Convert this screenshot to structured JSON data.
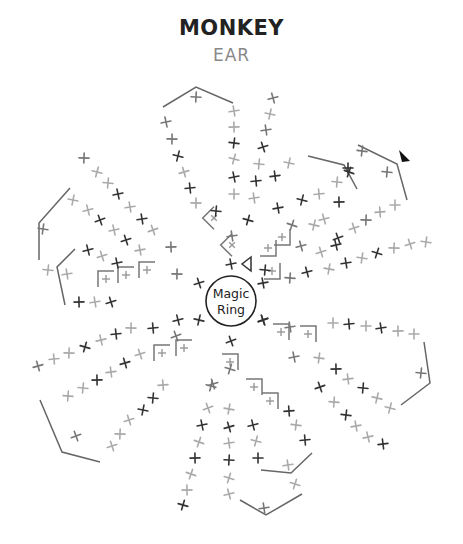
{
  "title": "MONKEY",
  "subtitle": "EAR",
  "center": {
    "label_line1": "Magic",
    "label_line2": "Ring",
    "x": 231,
    "y": 301,
    "r": 25
  },
  "colors": {
    "dark": "#333333",
    "mid": "#777777",
    "light": "#aaaaaa",
    "line": "#666666"
  },
  "symbols": [
    {
      "t": "x",
      "x": 231,
      "y": 264,
      "c": "dark"
    },
    {
      "t": "x",
      "x": 231,
      "y": 341,
      "c": "dark"
    },
    {
      "t": "x",
      "x": 199,
      "y": 283,
      "c": "dark"
    },
    {
      "t": "x",
      "x": 263,
      "y": 283,
      "c": "dark"
    },
    {
      "t": "x",
      "x": 199,
      "y": 320,
      "c": "dark"
    },
    {
      "t": "x",
      "x": 263,
      "y": 320,
      "c": "dark"
    },
    {
      "t": "x",
      "x": 196,
      "y": 97,
      "c": "mid"
    },
    {
      "t": "x",
      "x": 166,
      "y": 122,
      "c": "mid"
    },
    {
      "t": "x",
      "x": 172,
      "y": 139,
      "c": "mid"
    },
    {
      "t": "x",
      "x": 178,
      "y": 156,
      "c": "dark"
    },
    {
      "t": "x",
      "x": 184,
      "y": 172,
      "c": "light"
    },
    {
      "t": "x",
      "x": 190,
      "y": 188,
      "c": "dark"
    },
    {
      "t": "x",
      "x": 196,
      "y": 203,
      "c": "light"
    },
    {
      "t": "x",
      "x": 216,
      "y": 211,
      "c": "dark"
    },
    {
      "t": "x",
      "x": 234,
      "y": 111,
      "c": "light"
    },
    {
      "t": "x",
      "x": 234,
      "y": 127,
      "c": "light"
    },
    {
      "t": "x",
      "x": 234,
      "y": 143,
      "c": "dark"
    },
    {
      "t": "x",
      "x": 234,
      "y": 159,
      "c": "light"
    },
    {
      "t": "x",
      "x": 234,
      "y": 177,
      "c": "dark"
    },
    {
      "t": "x",
      "x": 234,
      "y": 194,
      "c": "light"
    },
    {
      "t": "x",
      "x": 273,
      "y": 98,
      "c": "mid"
    },
    {
      "t": "x",
      "x": 270,
      "y": 114,
      "c": "light"
    },
    {
      "t": "x",
      "x": 266,
      "y": 130,
      "c": "mid"
    },
    {
      "t": "x",
      "x": 263,
      "y": 147,
      "c": "dark"
    },
    {
      "t": "x",
      "x": 259,
      "y": 164,
      "c": "light"
    },
    {
      "t": "x",
      "x": 256,
      "y": 181,
      "c": "dark"
    },
    {
      "t": "x",
      "x": 254,
      "y": 198,
      "c": "light"
    },
    {
      "t": "x",
      "x": 248,
      "y": 220,
      "c": "dark"
    },
    {
      "t": "x",
      "x": 232,
      "y": 236,
      "c": "mid"
    },
    {
      "t": "x",
      "x": 348,
      "y": 168,
      "c": "dark"
    },
    {
      "t": "x",
      "x": 337,
      "y": 182,
      "c": "light"
    },
    {
      "t": "x",
      "x": 319,
      "y": 194,
      "c": "light"
    },
    {
      "t": "x",
      "x": 302,
      "y": 200,
      "c": "dark"
    },
    {
      "t": "x",
      "x": 292,
      "y": 225,
      "c": "mid"
    },
    {
      "t": "x",
      "x": 301,
      "y": 246,
      "c": "mid"
    },
    {
      "t": "x",
      "x": 289,
      "y": 163,
      "c": "light"
    },
    {
      "t": "x",
      "x": 275,
      "y": 176,
      "c": "dark"
    },
    {
      "t": "x",
      "x": 278,
      "y": 208,
      "c": "dark"
    },
    {
      "t": "x",
      "x": 314,
      "y": 225,
      "c": "light"
    },
    {
      "t": "x",
      "x": 339,
      "y": 202,
      "c": "dark"
    },
    {
      "t": "x",
      "x": 324,
      "y": 219,
      "c": "light"
    },
    {
      "t": "x",
      "x": 338,
      "y": 238,
      "c": "dark"
    },
    {
      "t": "x",
      "x": 354,
      "y": 228,
      "c": "light"
    },
    {
      "t": "x",
      "x": 366,
      "y": 220,
      "c": "mid"
    },
    {
      "t": "x",
      "x": 380,
      "y": 212,
      "c": "light"
    },
    {
      "t": "x",
      "x": 395,
      "y": 205,
      "c": "light"
    },
    {
      "t": "x",
      "x": 387,
      "y": 172,
      "c": "mid"
    },
    {
      "t": "x",
      "x": 349,
      "y": 172,
      "c": "dark"
    },
    {
      "t": "x",
      "x": 362,
      "y": 151,
      "c": "mid"
    },
    {
      "t": "x",
      "x": 321,
      "y": 252,
      "c": "light"
    },
    {
      "t": "x",
      "x": 336,
      "y": 245,
      "c": "dark"
    },
    {
      "t": "x",
      "x": 307,
      "y": 272,
      "c": "dark"
    },
    {
      "t": "x",
      "x": 329,
      "y": 269,
      "c": "light"
    },
    {
      "t": "x",
      "x": 346,
      "y": 263,
      "c": "dark"
    },
    {
      "t": "x",
      "x": 362,
      "y": 258,
      "c": "light"
    },
    {
      "t": "x",
      "x": 377,
      "y": 253,
      "c": "dark"
    },
    {
      "t": "x",
      "x": 394,
      "y": 248,
      "c": "light"
    },
    {
      "t": "x",
      "x": 410,
      "y": 244,
      "c": "light"
    },
    {
      "t": "x",
      "x": 426,
      "y": 242,
      "c": "light"
    },
    {
      "t": "x",
      "x": 290,
      "y": 278,
      "c": "mid"
    },
    {
      "t": "x",
      "x": 265,
      "y": 270,
      "c": "dark"
    },
    {
      "t": "x",
      "x": 84,
      "y": 158,
      "c": "mid"
    },
    {
      "t": "x",
      "x": 97,
      "y": 172,
      "c": "light"
    },
    {
      "t": "x",
      "x": 108,
      "y": 183,
      "c": "light"
    },
    {
      "t": "x",
      "x": 118,
      "y": 194,
      "c": "dark"
    },
    {
      "t": "x",
      "x": 130,
      "y": 207,
      "c": "light"
    },
    {
      "t": "x",
      "x": 142,
      "y": 219,
      "c": "dark"
    },
    {
      "t": "x",
      "x": 153,
      "y": 230,
      "c": "light"
    },
    {
      "t": "x",
      "x": 171,
      "y": 247,
      "c": "mid"
    },
    {
      "t": "x",
      "x": 73,
      "y": 200,
      "c": "light"
    },
    {
      "t": "x",
      "x": 88,
      "y": 210,
      "c": "light"
    },
    {
      "t": "x",
      "x": 100,
      "y": 220,
      "c": "dark"
    },
    {
      "t": "x",
      "x": 114,
      "y": 230,
      "c": "light"
    },
    {
      "t": "x",
      "x": 126,
      "y": 240,
      "c": "dark"
    },
    {
      "t": "x",
      "x": 140,
      "y": 250,
      "c": "light"
    },
    {
      "t": "x",
      "x": 88,
      "y": 250,
      "c": "dark"
    },
    {
      "t": "x",
      "x": 102,
      "y": 256,
      "c": "light"
    },
    {
      "t": "x",
      "x": 117,
      "y": 263,
      "c": "dark"
    },
    {
      "t": "x",
      "x": 43,
      "y": 229,
      "c": "mid"
    },
    {
      "t": "x",
      "x": 48,
      "y": 270,
      "c": "light"
    },
    {
      "t": "x",
      "x": 67,
      "y": 274,
      "c": "light"
    },
    {
      "t": "x",
      "x": 79,
      "y": 302,
      "c": "dark"
    },
    {
      "t": "x",
      "x": 95,
      "y": 302,
      "c": "light"
    },
    {
      "t": "x",
      "x": 111,
      "y": 302,
      "c": "dark"
    },
    {
      "t": "x",
      "x": 177,
      "y": 274,
      "c": "mid"
    },
    {
      "t": "x",
      "x": 38,
      "y": 366,
      "c": "mid"
    },
    {
      "t": "x",
      "x": 54,
      "y": 359,
      "c": "light"
    },
    {
      "t": "x",
      "x": 69,
      "y": 353,
      "c": "light"
    },
    {
      "t": "x",
      "x": 85,
      "y": 347,
      "c": "dark"
    },
    {
      "t": "x",
      "x": 101,
      "y": 340,
      "c": "light"
    },
    {
      "t": "x",
      "x": 116,
      "y": 334,
      "c": "dark"
    },
    {
      "t": "x",
      "x": 131,
      "y": 328,
      "c": "light"
    },
    {
      "t": "x",
      "x": 153,
      "y": 328,
      "c": "dark"
    },
    {
      "t": "x",
      "x": 178,
      "y": 320,
      "c": "dark"
    },
    {
      "t": "x",
      "x": 68,
      "y": 396,
      "c": "light"
    },
    {
      "t": "x",
      "x": 83,
      "y": 388,
      "c": "light"
    },
    {
      "t": "x",
      "x": 97,
      "y": 380,
      "c": "dark"
    },
    {
      "t": "x",
      "x": 111,
      "y": 372,
      "c": "light"
    },
    {
      "t": "x",
      "x": 125,
      "y": 363,
      "c": "dark"
    },
    {
      "t": "x",
      "x": 140,
      "y": 354,
      "c": "light"
    },
    {
      "t": "x",
      "x": 163,
      "y": 385,
      "c": "light"
    },
    {
      "t": "x",
      "x": 153,
      "y": 398,
      "c": "dark"
    },
    {
      "t": "x",
      "x": 143,
      "y": 410,
      "c": "dark"
    },
    {
      "t": "x",
      "x": 129,
      "y": 420,
      "c": "light"
    },
    {
      "t": "x",
      "x": 120,
      "y": 434,
      "c": "light"
    },
    {
      "t": "x",
      "x": 112,
      "y": 446,
      "c": "light"
    },
    {
      "t": "x",
      "x": 76,
      "y": 436,
      "c": "mid"
    },
    {
      "t": "x",
      "x": 176,
      "y": 336,
      "c": "mid"
    },
    {
      "t": "x",
      "x": 211,
      "y": 386,
      "c": "mid"
    },
    {
      "t": "x",
      "x": 208,
      "y": 408,
      "c": "light"
    },
    {
      "t": "x",
      "x": 202,
      "y": 425,
      "c": "dark"
    },
    {
      "t": "x",
      "x": 199,
      "y": 442,
      "c": "light"
    },
    {
      "t": "x",
      "x": 195,
      "y": 458,
      "c": "dark"
    },
    {
      "t": "x",
      "x": 191,
      "y": 474,
      "c": "light"
    },
    {
      "t": "x",
      "x": 187,
      "y": 490,
      "c": "light"
    },
    {
      "t": "x",
      "x": 183,
      "y": 505,
      "c": "dark"
    },
    {
      "t": "x",
      "x": 229,
      "y": 409,
      "c": "light"
    },
    {
      "t": "x",
      "x": 229,
      "y": 427,
      "c": "dark"
    },
    {
      "t": "x",
      "x": 229,
      "y": 443,
      "c": "light"
    },
    {
      "t": "x",
      "x": 229,
      "y": 460,
      "c": "dark"
    },
    {
      "t": "x",
      "x": 229,
      "y": 478,
      "c": "light"
    },
    {
      "t": "x",
      "x": 229,
      "y": 494,
      "c": "light"
    },
    {
      "t": "x",
      "x": 253,
      "y": 425,
      "c": "dark"
    },
    {
      "t": "x",
      "x": 256,
      "y": 441,
      "c": "light"
    },
    {
      "t": "x",
      "x": 258,
      "y": 458,
      "c": "dark"
    },
    {
      "t": "x",
      "x": 289,
      "y": 411,
      "c": "dark"
    },
    {
      "t": "x",
      "x": 296,
      "y": 425,
      "c": "light"
    },
    {
      "t": "x",
      "x": 305,
      "y": 440,
      "c": "dark"
    },
    {
      "t": "x",
      "x": 288,
      "y": 465,
      "c": "light"
    },
    {
      "t": "x",
      "x": 295,
      "y": 484,
      "c": "light"
    },
    {
      "t": "x",
      "x": 264,
      "y": 508,
      "c": "mid"
    },
    {
      "t": "x",
      "x": 230,
      "y": 369,
      "c": "mid"
    },
    {
      "t": "x",
      "x": 213,
      "y": 384,
      "c": "mid"
    },
    {
      "t": "x",
      "x": 294,
      "y": 357,
      "c": "mid"
    },
    {
      "t": "x",
      "x": 319,
      "y": 358,
      "c": "light"
    },
    {
      "t": "x",
      "x": 336,
      "y": 369,
      "c": "dark"
    },
    {
      "t": "x",
      "x": 348,
      "y": 379,
      "c": "light"
    },
    {
      "t": "x",
      "x": 363,
      "y": 388,
      "c": "dark"
    },
    {
      "t": "x",
      "x": 377,
      "y": 398,
      "c": "light"
    },
    {
      "t": "x",
      "x": 390,
      "y": 408,
      "c": "light"
    },
    {
      "t": "x",
      "x": 320,
      "y": 387,
      "c": "dark"
    },
    {
      "t": "x",
      "x": 334,
      "y": 402,
      "c": "light"
    },
    {
      "t": "x",
      "x": 346,
      "y": 415,
      "c": "dark"
    },
    {
      "t": "x",
      "x": 356,
      "y": 426,
      "c": "light"
    },
    {
      "t": "x",
      "x": 368,
      "y": 437,
      "c": "light"
    },
    {
      "t": "x",
      "x": 383,
      "y": 444,
      "c": "dark"
    },
    {
      "t": "x",
      "x": 333,
      "y": 323,
      "c": "light"
    },
    {
      "t": "x",
      "x": 349,
      "y": 324,
      "c": "dark"
    },
    {
      "t": "x",
      "x": 366,
      "y": 326,
      "c": "light"
    },
    {
      "t": "x",
      "x": 381,
      "y": 328,
      "c": "dark"
    },
    {
      "t": "x",
      "x": 398,
      "y": 331,
      "c": "light"
    },
    {
      "t": "x",
      "x": 414,
      "y": 334,
      "c": "light"
    },
    {
      "t": "x",
      "x": 421,
      "y": 373,
      "c": "mid"
    },
    {
      "t": "x",
      "x": 263,
      "y": 320,
      "c": "dark"
    },
    {
      "t": "x",
      "x": 290,
      "y": 327,
      "c": "mid"
    }
  ],
  "boxes": [
    {
      "x": 214,
      "y": 218,
      "rot": 45
    },
    {
      "x": 232,
      "y": 245,
      "rot": 45
    },
    {
      "x": 268,
      "y": 248,
      "rot": -90
    },
    {
      "x": 272,
      "y": 271,
      "rot": -90
    },
    {
      "x": 282,
      "y": 237,
      "rot": -90
    },
    {
      "x": 147,
      "y": 270,
      "rot": 90
    },
    {
      "x": 126,
      "y": 275,
      "rot": 90
    },
    {
      "x": 106,
      "y": 279,
      "rot": 90
    },
    {
      "x": 184,
      "y": 348,
      "rot": 90
    },
    {
      "x": 162,
      "y": 353,
      "rot": 90
    },
    {
      "x": 230,
      "y": 362,
      "rot": 180
    },
    {
      "x": 254,
      "y": 387,
      "rot": 180
    },
    {
      "x": 270,
      "y": 401,
      "rot": 180
    },
    {
      "x": 281,
      "y": 332,
      "rot": 180
    },
    {
      "x": 308,
      "y": 334,
      "rot": 180
    }
  ],
  "polylines": [
    [
      [
        163,
        107
      ],
      [
        196,
        87
      ],
      [
        233,
        103
      ]
    ],
    [
      [
        308,
        156
      ],
      [
        344,
        165
      ],
      [
        357,
        189
      ]
    ],
    [
      [
        358,
        145
      ],
      [
        397,
        164
      ],
      [
        407,
        200
      ]
    ],
    [
      [
        70,
        188
      ],
      [
        39,
        223
      ],
      [
        39,
        260
      ]
    ],
    [
      [
        75,
        249
      ],
      [
        57,
        267
      ],
      [
        65,
        305
      ]
    ],
    [
      [
        40,
        400
      ],
      [
        62,
        452
      ],
      [
        100,
        462
      ]
    ],
    [
      [
        424,
        342
      ],
      [
        430,
        383
      ],
      [
        401,
        405
      ]
    ],
    [
      [
        240,
        500
      ],
      [
        266,
        515
      ],
      [
        302,
        494
      ]
    ],
    [
      [
        261,
        470
      ],
      [
        291,
        473
      ],
      [
        312,
        453
      ]
    ]
  ],
  "triangle_marker": {
    "x": 404,
    "y": 157
  },
  "open_triangle": {
    "x": 247,
    "y": 264
  }
}
